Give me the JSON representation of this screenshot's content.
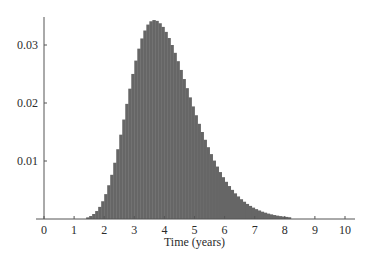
{
  "chart_data": {
    "type": "bar",
    "title": "",
    "xlabel": "Time (years)",
    "ylabel": "",
    "xlim": [
      0,
      10
    ],
    "ylim": [
      0,
      0.035
    ],
    "grid": false,
    "legend": "none",
    "bar_color": "#666666",
    "bin_width": 0.1,
    "x_ticks": [
      0,
      1,
      2,
      3,
      4,
      5,
      6,
      7,
      8,
      9,
      10
    ],
    "x_tick_labels": [
      "0",
      "1",
      "2",
      "3",
      "4",
      "5",
      "6",
      "7",
      "8",
      "9",
      "10"
    ],
    "y_ticks": [
      0.01,
      0.02,
      0.03
    ],
    "y_tick_labels": [
      "0.01",
      "0.02",
      "0.03"
    ],
    "x": [
      1.45,
      1.55,
      1.65,
      1.75,
      1.85,
      1.95,
      2.05,
      2.15,
      2.25,
      2.35,
      2.45,
      2.55,
      2.65,
      2.75,
      2.85,
      2.95,
      3.05,
      3.15,
      3.25,
      3.35,
      3.45,
      3.55,
      3.65,
      3.75,
      3.85,
      3.95,
      4.05,
      4.15,
      4.25,
      4.35,
      4.45,
      4.55,
      4.65,
      4.75,
      4.85,
      4.95,
      5.05,
      5.15,
      5.25,
      5.35,
      5.45,
      5.55,
      5.65,
      5.75,
      5.85,
      5.95,
      6.05,
      6.15,
      6.25,
      6.35,
      6.45,
      6.55,
      6.65,
      6.75,
      6.85,
      6.95,
      7.05,
      7.15,
      7.25,
      7.35,
      7.45,
      7.55,
      7.65,
      7.75,
      7.85,
      7.95,
      8.05,
      8.15
    ],
    "values": [
      0.00028,
      0.00051,
      0.00086,
      0.00137,
      0.00209,
      0.00306,
      0.00429,
      0.00582,
      0.00762,
      0.0097,
      0.01203,
      0.01454,
      0.01715,
      0.01985,
      0.02247,
      0.02501,
      0.02731,
      0.02937,
      0.03113,
      0.0325,
      0.03352,
      0.03409,
      0.0343,
      0.03416,
      0.03375,
      0.03312,
      0.03226,
      0.0312,
      0.03,
      0.02865,
      0.02721,
      0.0257,
      0.02413,
      0.02256,
      0.02097,
      0.01941,
      0.01789,
      0.01641,
      0.015,
      0.01366,
      0.01238,
      0.01119,
      0.01007,
      0.00904,
      0.00809,
      0.00721,
      0.00641,
      0.00568,
      0.00502,
      0.00442,
      0.00389,
      0.00341,
      0.00298,
      0.0026,
      0.00226,
      0.00196,
      0.0017,
      0.00147,
      0.00126,
      0.00109,
      0.00093,
      0.0008,
      0.00068,
      0.00058,
      0.0005,
      0.00042,
      0.00036,
      0.0003
    ]
  }
}
